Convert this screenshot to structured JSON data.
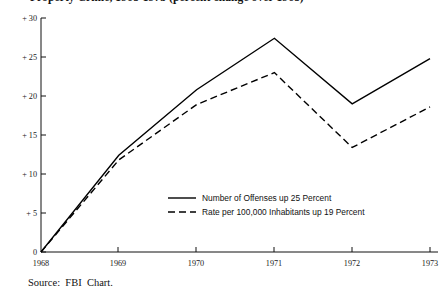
{
  "title": {
    "text": "Property Crime, 1968-1973  (percent change over 1968)",
    "visible_note": "clipped at top edge"
  },
  "source": {
    "label": "Source:  FBI  Chart."
  },
  "axes": {
    "y_ticks": [
      "0",
      "+ 5",
      "+ 10",
      "+ 15",
      "+ 20",
      "+ 25",
      "+ 30"
    ],
    "x_ticks": [
      "1968",
      "1969",
      "1970",
      "1971",
      "1972",
      "1973"
    ]
  },
  "legend": {
    "items": [
      {
        "label": "Number of Offenses up 25 Percent",
        "style": "solid"
      },
      {
        "label": "Rate per 100,000 Inhabitants up 19 Percent",
        "style": "dashed"
      }
    ]
  },
  "chart_data": {
    "type": "line",
    "title": "Property Crime, 1968-1973 (percent change over 1968)",
    "xlabel": "",
    "ylabel": "Percent change",
    "x": [
      "1968",
      "1969",
      "1970",
      "1971",
      "1972",
      "1973"
    ],
    "xlim": [
      "1968",
      "1973"
    ],
    "ylim": [
      0,
      30
    ],
    "yticks": [
      0,
      5,
      10,
      15,
      20,
      25,
      30
    ],
    "ytick_labels": [
      "0",
      "+ 5",
      "+ 10",
      "+ 15",
      "+ 20",
      "+ 25",
      "+ 30"
    ],
    "grid": false,
    "legend_position": "center",
    "series": [
      {
        "name": "Number of Offenses up 25 Percent",
        "style": "solid",
        "color": "#000000",
        "values": [
          0,
          12.4,
          20.8,
          27.4,
          19.0,
          24.8
        ]
      },
      {
        "name": "Rate per 100,000 Inhabitants up 19 Percent",
        "style": "dashed",
        "color": "#000000",
        "values": [
          0,
          11.8,
          18.9,
          23.0,
          13.4,
          18.6
        ]
      }
    ],
    "source": "FBI Chart."
  },
  "colors": {
    "axis": "#111111",
    "series": "#000000",
    "background": "#ffffff"
  }
}
